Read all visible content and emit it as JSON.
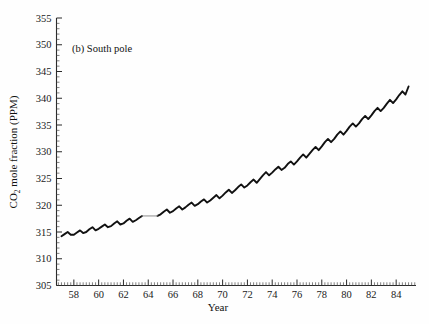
{
  "figure": {
    "panel_label": "(b) South pole",
    "background_color": "#fefefe",
    "curve_color": "#111111",
    "axis_color": "#2b2b2b"
  },
  "axes": {
    "y_title_main": "CO",
    "y_title_sub": "2",
    "y_title_rest": " mole fraction (PPM)",
    "x_title": "Year",
    "y_ticks": [
      "305",
      "310",
      "315",
      "320",
      "325",
      "330",
      "335",
      "340",
      "345",
      "350",
      "355"
    ],
    "x_ticks": [
      "58",
      "60",
      "62",
      "64",
      "66",
      "68",
      "70",
      "72",
      "74",
      "76",
      "78",
      "80",
      "82",
      "84"
    ]
  },
  "chart_data": {
    "type": "line",
    "title": "(b) South pole",
    "xlabel": "Year",
    "ylabel": "CO2 mole fraction (PPM)",
    "xlim": [
      56.6,
      85.6
    ],
    "ylim": [
      305,
      355
    ],
    "grid": false,
    "legend": null,
    "y_tick_values": [
      305,
      310,
      315,
      320,
      325,
      330,
      335,
      340,
      345,
      350,
      355
    ],
    "x_tick_values": [
      58,
      60,
      62,
      64,
      66,
      68,
      70,
      72,
      74,
      76,
      78,
      80,
      82,
      84
    ],
    "y_minor_tick_step": 1,
    "x_minor_tick_step": 0.25,
    "series": [
      {
        "name": "South Pole CO2 mole fraction (monthly)",
        "note": "Rising trend with seasonal oscillation; lighter thin segment near 1963.7-1964.5 indicates interpolated data gap.",
        "x": [
          57.0,
          57.25,
          57.5,
          57.75,
          58.0,
          58.25,
          58.5,
          58.75,
          59.0,
          59.25,
          59.5,
          59.75,
          60.0,
          60.25,
          60.5,
          60.75,
          61.0,
          61.25,
          61.5,
          61.75,
          62.0,
          62.25,
          62.5,
          62.75,
          63.0,
          63.25,
          63.5,
          63.75,
          64.0,
          64.25,
          64.5,
          64.75,
          65.0,
          65.25,
          65.5,
          65.75,
          66.0,
          66.25,
          66.5,
          66.75,
          67.0,
          67.25,
          67.5,
          67.75,
          68.0,
          68.25,
          68.5,
          68.75,
          69.0,
          69.25,
          69.5,
          69.75,
          70.0,
          70.25,
          70.5,
          70.75,
          71.0,
          71.25,
          71.5,
          71.75,
          72.0,
          72.25,
          72.5,
          72.75,
          73.0,
          73.25,
          73.5,
          73.75,
          74.0,
          74.25,
          74.5,
          74.75,
          75.0,
          75.25,
          75.5,
          75.75,
          76.0,
          76.25,
          76.5,
          76.75,
          77.0,
          77.25,
          77.5,
          77.75,
          78.0,
          78.25,
          78.5,
          78.75,
          79.0,
          79.25,
          79.5,
          79.75,
          80.0,
          80.25,
          80.5,
          80.75,
          81.0,
          81.25,
          81.5,
          81.75,
          82.0,
          82.25,
          82.5,
          82.75,
          83.0,
          83.25,
          83.5,
          83.75,
          84.0,
          84.25,
          84.5,
          84.75,
          85.0
        ],
        "y": [
          314.2,
          314.6,
          315.0,
          314.5,
          314.5,
          314.9,
          315.3,
          314.8,
          315.0,
          315.5,
          315.9,
          315.3,
          315.6,
          316.0,
          316.4,
          315.9,
          316.1,
          316.6,
          317.0,
          316.4,
          316.6,
          317.1,
          317.5,
          316.9,
          317.2,
          317.6,
          318.0,
          317.4,
          317.7,
          318.1,
          318.5,
          318.0,
          318.3,
          318.8,
          319.2,
          318.6,
          318.9,
          319.4,
          319.8,
          319.2,
          319.6,
          320.1,
          320.5,
          319.9,
          320.2,
          320.7,
          321.1,
          320.5,
          320.9,
          321.4,
          321.9,
          321.3,
          321.8,
          322.4,
          322.9,
          322.3,
          322.8,
          323.4,
          323.9,
          323.3,
          323.7,
          324.3,
          324.8,
          324.2,
          324.9,
          325.6,
          326.2,
          325.6,
          326.1,
          326.7,
          327.2,
          326.6,
          327.0,
          327.7,
          328.2,
          327.6,
          328.2,
          328.9,
          329.5,
          328.9,
          329.6,
          330.3,
          330.9,
          330.3,
          331.0,
          331.8,
          332.4,
          331.8,
          332.4,
          333.2,
          333.8,
          333.2,
          333.9,
          334.7,
          335.3,
          334.7,
          335.3,
          336.1,
          336.7,
          336.1,
          336.8,
          337.6,
          338.2,
          337.6,
          338.2,
          339.0,
          339.7,
          339.1,
          339.8,
          340.6,
          341.3,
          340.7,
          342.2
        ]
      }
    ]
  }
}
